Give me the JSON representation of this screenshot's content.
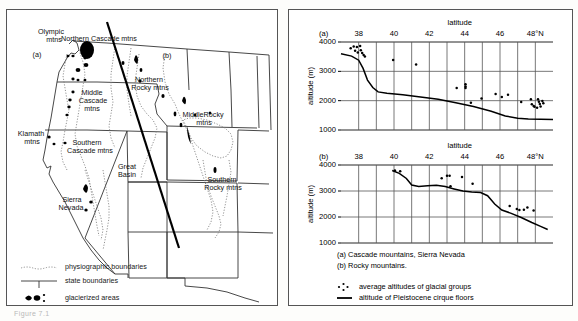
{
  "figure": {
    "caption": "Figure 7.1"
  },
  "map": {
    "region_labels": [
      {
        "id": "olympic",
        "text": "Olympic",
        "x": 44,
        "y": 22
      },
      {
        "id": "olympic2",
        "text": "mtns",
        "x": 47,
        "y": 30
      },
      {
        "id": "northern-cascade",
        "text": "Northern Cascade mtns",
        "x": 92,
        "y": 29
      },
      {
        "id": "panel-a",
        "text": "(a)",
        "x": 30,
        "y": 45
      },
      {
        "id": "panel-b",
        "text": "(b)",
        "x": 160,
        "y": 46
      },
      {
        "id": "northern-rocky",
        "text": "Northern",
        "x": 142,
        "y": 70
      },
      {
        "id": "northern-rocky2",
        "text": "Rocky mtns",
        "x": 143,
        "y": 78
      },
      {
        "id": "middle-cascade",
        "text": "Middle",
        "x": 85,
        "y": 83
      },
      {
        "id": "middle-cascade2",
        "text": "Cascade",
        "x": 86,
        "y": 91
      },
      {
        "id": "middle-cascade3",
        "text": "mtns",
        "x": 85,
        "y": 99
      },
      {
        "id": "middle-rocky",
        "text": "MiddleRocky",
        "x": 196,
        "y": 105
      },
      {
        "id": "middle-rocky2",
        "text": "mtns",
        "x": 197,
        "y": 113
      },
      {
        "id": "klamath",
        "text": "Klamath",
        "x": 24,
        "y": 124
      },
      {
        "id": "klamath2",
        "text": "mtns",
        "x": 25,
        "y": 132
      },
      {
        "id": "southern-cascade",
        "text": "Southern",
        "x": 80,
        "y": 133
      },
      {
        "id": "southern-cascade2",
        "text": "Cascade mtns",
        "x": 83,
        "y": 141
      },
      {
        "id": "great-basin",
        "text": "Great",
        "x": 120,
        "y": 157
      },
      {
        "id": "great-basin2",
        "text": "Basin",
        "x": 120,
        "y": 165
      },
      {
        "id": "southern-rocky",
        "text": "Southern",
        "x": 215,
        "y": 170
      },
      {
        "id": "southern-rocky2",
        "text": "Rocky mtns",
        "x": 216,
        "y": 178
      },
      {
        "id": "sierra-nevada",
        "text": "Sierra",
        "x": 65,
        "y": 190
      },
      {
        "id": "sierra-nevada2",
        "text": "Nevada",
        "x": 64,
        "y": 198
      }
    ],
    "legend": [
      {
        "id": "physiographic",
        "label": "physiographic boundaries",
        "symbol": "dotted-line"
      },
      {
        "id": "state",
        "label": "state boundaries",
        "symbol": "solid-line"
      },
      {
        "id": "glacierized",
        "label": "glacierized areas",
        "symbol": "black-blobs"
      }
    ]
  },
  "chart_data": [
    {
      "id": "chart-a",
      "type": "scatter",
      "panel_label": "(a)",
      "title": "",
      "xlabel": "latitude",
      "ylabel": "altitude (m)",
      "xlim": [
        37,
        49
      ],
      "ylim": [
        1000,
        4000
      ],
      "yticks": [
        1000,
        2000,
        3000,
        4000
      ],
      "xticks": [
        38,
        39,
        40,
        41,
        42,
        43,
        44,
        45,
        46,
        47,
        48
      ],
      "xticklabels": [
        "38",
        "",
        "40",
        "",
        "42",
        "",
        "44",
        "",
        "46",
        "",
        "48°N"
      ],
      "grid": true,
      "series": [
        {
          "name": "average altitudes of glacial groups",
          "type": "scatter",
          "points": [
            [
              37.55,
              3790
            ],
            [
              37.72,
              3850
            ],
            [
              37.8,
              3700
            ],
            [
              37.9,
              3830
            ],
            [
              37.95,
              3640
            ],
            [
              38.08,
              3860
            ],
            [
              38.12,
              3720
            ],
            [
              38.2,
              3620
            ],
            [
              38.28,
              3560
            ],
            [
              38.35,
              3510
            ],
            [
              39.95,
              3390
            ],
            [
              41.25,
              3230
            ],
            [
              43.55,
              2430
            ],
            [
              44.05,
              2560
            ],
            [
              44.05,
              2480
            ],
            [
              44.05,
              2430
            ],
            [
              44.35,
              1930
            ],
            [
              44.95,
              2070
            ],
            [
              45.75,
              2230
            ],
            [
              46.1,
              2130
            ],
            [
              46.45,
              2200
            ],
            [
              47.2,
              1950
            ],
            [
              47.75,
              2050
            ],
            [
              47.8,
              1880
            ],
            [
              47.9,
              1820
            ],
            [
              48.15,
              2050
            ],
            [
              48.2,
              1960
            ],
            [
              48.25,
              1890
            ],
            [
              48.3,
              1800
            ],
            [
              48.4,
              1990
            ],
            [
              48.45,
              1910
            ],
            [
              47.95,
              1790
            ],
            [
              48.1,
              1760
            ]
          ]
        },
        {
          "name": "altitude of Pleistocene cirque floors",
          "type": "line",
          "points": [
            [
              37.0,
              3600
            ],
            [
              37.6,
              3520
            ],
            [
              38.0,
              3380
            ],
            [
              38.25,
              3100
            ],
            [
              38.5,
              2700
            ],
            [
              38.8,
              2450
            ],
            [
              39.1,
              2300
            ],
            [
              39.6,
              2250
            ],
            [
              40.5,
              2200
            ],
            [
              41.5,
              2130
            ],
            [
              42.5,
              2050
            ],
            [
              43.5,
              1930
            ],
            [
              44.5,
              1800
            ],
            [
              45.5,
              1640
            ],
            [
              46.3,
              1480
            ],
            [
              47.0,
              1400
            ],
            [
              47.6,
              1370
            ],
            [
              49.0,
              1360
            ]
          ]
        }
      ]
    },
    {
      "id": "chart-b",
      "type": "scatter",
      "panel_label": "(b)",
      "title": "",
      "xlabel": "latitude",
      "ylabel": "altitude (m)",
      "xlim": [
        37,
        49
      ],
      "ylim": [
        1000,
        4000
      ],
      "yticks": [
        1000,
        2000,
        3000,
        4000
      ],
      "xticks": [
        38,
        39,
        40,
        41,
        42,
        43,
        44,
        45,
        46,
        47,
        48
      ],
      "xticklabels": [
        "38",
        "",
        "40",
        "",
        "42",
        "",
        "44",
        "",
        "46",
        "",
        "48°N"
      ],
      "grid": true,
      "series": [
        {
          "name": "average altitudes of glacial groups",
          "type": "scatter",
          "points": [
            [
              40.05,
              3790
            ],
            [
              40.35,
              3760
            ],
            [
              42.7,
              3490
            ],
            [
              43.0,
              3590
            ],
            [
              43.15,
              3590
            ],
            [
              43.2,
              3180
            ],
            [
              43.85,
              3540
            ],
            [
              44.45,
              3280
            ],
            [
              46.55,
              2420
            ],
            [
              46.95,
              2310
            ],
            [
              47.35,
              2280
            ],
            [
              47.55,
              2370
            ],
            [
              47.9,
              2250
            ],
            [
              47.1,
              2270
            ]
          ]
        },
        {
          "name": "altitude of Pleistocene cirque floors",
          "type": "line",
          "points": [
            [
              39.9,
              3790
            ],
            [
              40.3,
              3680
            ],
            [
              40.7,
              3480
            ],
            [
              41.0,
              3230
            ],
            [
              41.4,
              3170
            ],
            [
              41.9,
              3200
            ],
            [
              42.4,
              3220
            ],
            [
              42.9,
              3170
            ],
            [
              43.4,
              3080
            ],
            [
              43.9,
              3000
            ],
            [
              44.4,
              2960
            ],
            [
              44.9,
              2940
            ],
            [
              45.3,
              2820
            ],
            [
              45.7,
              2500
            ],
            [
              46.1,
              2270
            ],
            [
              46.6,
              2150
            ],
            [
              47.2,
              1980
            ],
            [
              47.8,
              1790
            ],
            [
              48.3,
              1640
            ],
            [
              48.7,
              1520
            ]
          ]
        }
      ]
    }
  ],
  "chart_notes": [
    "(a) Cascade mountains, Sierra Nevada",
    "(b) Rocky mountains."
  ],
  "chart_legend": [
    {
      "id": "points",
      "label": "average altitudes of glacial groups",
      "symbol": "dots"
    },
    {
      "id": "line",
      "label": "altitude of Pleistocene cirque floors",
      "symbol": "line"
    }
  ]
}
